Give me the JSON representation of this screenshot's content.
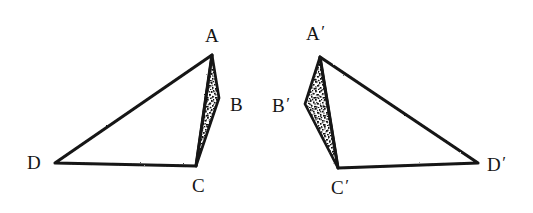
{
  "figure": {
    "background_color": "#ffffff",
    "ink_color": "#141414",
    "shading": {
      "name": "stipple-hatch",
      "description": "dense black speckle / stipple fill",
      "dot_color": "#101010",
      "base_color": "#ffffff"
    },
    "left_figure": {
      "name": "figure-abcd",
      "outline_order": [
        "A",
        "C",
        "D"
      ],
      "shaded_triangle": [
        "A",
        "B",
        "C"
      ],
      "vertices": [
        {
          "id": "A",
          "label": "A",
          "prime": "",
          "x": 212,
          "y": 55,
          "label_x": 205,
          "label_y": 26
        },
        {
          "id": "B",
          "label": "B",
          "prime": "",
          "x": 219,
          "y": 98,
          "label_x": 230,
          "label_y": 95
        },
        {
          "id": "C",
          "label": "C",
          "prime": "",
          "x": 196,
          "y": 166,
          "label_x": 192,
          "label_y": 176
        },
        {
          "id": "D",
          "label": "D",
          "prime": "",
          "x": 55,
          "y": 163,
          "label_x": 27,
          "label_y": 153
        }
      ]
    },
    "right_figure": {
      "name": "figure-abcd-prime",
      "outline_order": [
        "A'",
        "C'",
        "D'"
      ],
      "shaded_triangle": [
        "A'",
        "B'",
        "C'"
      ],
      "vertices": [
        {
          "id": "Ap",
          "label": "A",
          "prime": "′",
          "x": 320,
          "y": 57,
          "label_x": 306,
          "label_y": 24
        },
        {
          "id": "Bp",
          "label": "B",
          "prime": "′",
          "x": 305,
          "y": 104,
          "label_x": 272,
          "label_y": 96
        },
        {
          "id": "Cp",
          "label": "C",
          "prime": "′",
          "x": 338,
          "y": 168,
          "label_x": 331,
          "label_y": 178
        },
        {
          "id": "Dp",
          "label": "D",
          "prime": "′",
          "x": 478,
          "y": 163,
          "label_x": 487,
          "label_y": 155
        }
      ]
    }
  }
}
